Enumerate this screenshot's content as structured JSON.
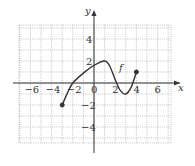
{
  "chart_data": {
    "type": "line",
    "title": "",
    "xlabel": "x",
    "ylabel": "y",
    "curve_label": "f",
    "xlim": [
      -7,
      7.5
    ],
    "ylim": [
      -5.5,
      5.3
    ],
    "grid": true,
    "grid_step": 1,
    "x_ticks": [
      -6,
      -4,
      -2,
      0,
      2,
      4,
      6
    ],
    "y_ticks": [
      4,
      2,
      -2,
      -4
    ],
    "tick_labels": {
      "x": [
        "−6",
        "−4",
        "−2",
        "0",
        "2",
        "4",
        "6"
      ],
      "y": [
        "4",
        "2",
        "−2",
        "−4"
      ]
    },
    "series": [
      {
        "name": "f",
        "points": [
          [
            -3,
            -2
          ],
          [
            -2.5,
            -0.9
          ],
          [
            -2,
            0
          ],
          [
            -1,
            0.9
          ],
          [
            0,
            1.6
          ],
          [
            1,
            2
          ],
          [
            1.5,
            1.5
          ],
          [
            2,
            0.3
          ],
          [
            2.5,
            -0.7
          ],
          [
            3,
            -1
          ],
          [
            3.5,
            -0.4
          ],
          [
            4,
            1
          ]
        ],
        "endpoints": [
          {
            "x": -3,
            "y": -2,
            "closed": true
          },
          {
            "x": 4,
            "y": 1,
            "closed": true
          }
        ]
      }
    ]
  }
}
